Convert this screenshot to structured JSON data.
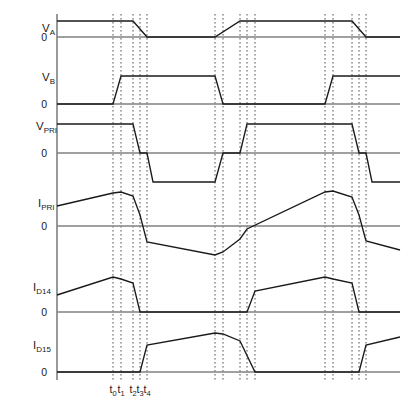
{
  "figure": {
    "background_color": "#ffffff",
    "trace_color": "#1a1a1a",
    "zero_line_color": "#808080",
    "axis_color": "#808080",
    "marker_color": "#555555"
  },
  "axes": {
    "vertical_axis_x": 57,
    "plot_left": 57,
    "plot_right": 400,
    "plot_top": 14,
    "plot_bottom": 380
  },
  "time_markers": {
    "labels": [
      "t0",
      "t1",
      "t2",
      "t3",
      "t4"
    ],
    "label_bases": [
      "t",
      "t",
      "t",
      "t",
      "t"
    ],
    "label_subs": [
      "0",
      "1",
      "2",
      "3",
      "4"
    ],
    "group1_x": [
      113,
      121,
      133,
      140,
      147
    ],
    "group2_x": [
      215,
      223,
      240,
      247,
      255
    ],
    "group3_x": [
      325,
      333,
      352,
      359,
      366
    ],
    "label_y": 393,
    "dotted_top": 14,
    "dotted_bottom": 380
  },
  "signals": [
    {
      "name": "V_A",
      "label_base": "V",
      "label_sub": "A",
      "label_x": 42,
      "label_y": 32,
      "zero_label": "0",
      "zero_label_x": 47,
      "zero_label_y": 41,
      "zero_y": 37,
      "high_y": 21,
      "description": "Gate drive A: high at start, falls t2-t4, low, rises in second half-cycle, falls again at end",
      "points": "57,21 133,21 147,37 215,37 240,21 352,21 366,37 400,37"
    },
    {
      "name": "V_B",
      "label_base": "V",
      "label_sub": "B",
      "label_x": 42,
      "label_y": 81,
      "zero_label": "0",
      "zero_label_x": 47,
      "zero_label_y": 108,
      "zero_y": 104,
      "high_y": 76,
      "description": "Gate drive B: low at start, rises t0-t1, high, falls at group2 t0-t1, low, rises at group3",
      "points": "57,104 113,104 121,76 215,76 223,104 325,104 333,76 400,76"
    },
    {
      "name": "V_PRI",
      "label_base": "V",
      "label_sub": "PRI",
      "label_x": 36,
      "label_y": 130,
      "zero_label": "0",
      "zero_label_x": 47,
      "zero_label_y": 157,
      "zero_y": 153,
      "high_y": 124,
      "low_y": 182,
      "description": "Primary voltage: positive plateau, falls to zero at t2-t3, dead time, negative plateau, returns to zero, positive plateau second half, then negative",
      "points": "57,124 133,124 140,153 147,153 153,182 215,182 223,153 240,153 247,124 352,124 359,153 366,153 372,182 400,182"
    },
    {
      "name": "I_PRI",
      "label_base": "I",
      "label_sub": "PRI",
      "label_x": 38,
      "label_y": 207,
      "zero_label": "0",
      "zero_label_x": 47,
      "zero_label_y": 230,
      "zero_y": 226,
      "description": "Primary current: ramps up to peak near t0-t1, slight decline to t2, steep fall through zero to negative, slowly decays, then mirrored in second half-cycle",
      "points": "57,206 113,193 121,192 133,196 140,215 147,242 215,255 223,252 240,239 247,229 325,192 333,191 352,197 359,215 366,241 400,250"
    },
    {
      "name": "I_D14",
      "label_base": "I",
      "label_sub": "D14",
      "label_x": 33,
      "label_y": 291,
      "zero_label": "0",
      "zero_label_x": 47,
      "zero_label_y": 316,
      "zero_y": 312,
      "description": "Rectifier diode D14 current: ramps up, peaks at t0, slight decline to t2, steep fall to zero at t3, stays zero through dead time and opposite half-cycle, restarts at group2 t3",
      "points": "57,295 113,277 121,279 133,283 140,312 247,312 255,291 325,277 333,279 352,283 359,312 400,312"
    },
    {
      "name": "I_D15",
      "label_base": "I",
      "label_sub": "D15",
      "label_x": 33,
      "label_y": 349,
      "zero_label": "0",
      "zero_label_x": 47,
      "zero_label_y": 376,
      "zero_y": 372,
      "description": "Rectifier diode D15 current: zero during first half-cycle, rises at t3-t4, ramps to peak near group2 t0, declines to group2 t2, falls to zero at group2 t4, restarts at group3 t3",
      "points": "57,372 140,372 147,345 215,333 223,334 240,341 255,372 359,372 366,345 400,337"
    }
  ]
}
